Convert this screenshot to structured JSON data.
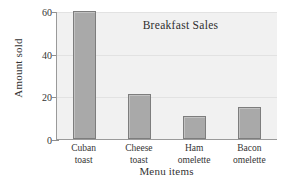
{
  "chart_data": {
    "type": "bar",
    "title": "Breakfast Sales",
    "xlabel": "Menu items",
    "ylabel": "Amount sold",
    "categories": [
      "Cuban toast",
      "Cheese toast",
      "Ham omelette",
      "Bacon omelette"
    ],
    "category_lines": [
      [
        "Cuban",
        "toast"
      ],
      [
        "Cheese",
        "toast"
      ],
      [
        "Ham",
        "omelette"
      ],
      [
        "Bacon",
        "omelette"
      ]
    ],
    "values": [
      60,
      21,
      11,
      15
    ],
    "ylim": [
      0,
      60
    ],
    "yticks": [
      0,
      20,
      40,
      60
    ],
    "ytick_labels": [
      "0",
      "20",
      "40",
      "60"
    ],
    "grid": true,
    "legend": "none",
    "colors": {
      "bar_fill": "#a9a9a9",
      "bar_border": "#7d7d7d",
      "plot_background": "#f1f1f1",
      "gridline": "#e2e2e2",
      "axis": "#9a9a9a",
      "text": "#343434",
      "page_background": "#ffffff"
    }
  }
}
